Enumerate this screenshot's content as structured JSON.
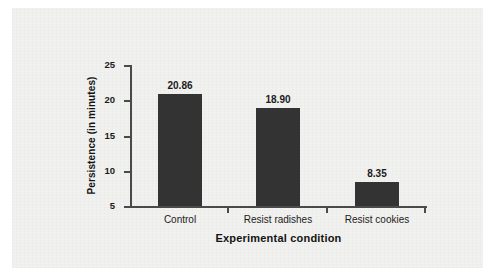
{
  "chart_data": {
    "type": "bar",
    "title": "",
    "subtitle": "",
    "xlabel": "Experimental condition",
    "ylabel": "Persistence (in minutes)",
    "categories": [
      "Control",
      "Resist radishes",
      "Resist cookies"
    ],
    "values": [
      20.86,
      18.9,
      8.35
    ],
    "value_labels": [
      "20.86",
      "18.90",
      "8.35"
    ],
    "ylim": [
      5,
      25
    ],
    "yticks": [
      5,
      10,
      15,
      20,
      25
    ],
    "ytick_labels": [
      "5",
      "10",
      "15",
      "20",
      "25"
    ],
    "grid": false,
    "legend": false,
    "legend_position": "none",
    "bar_color": "#333333",
    "axis_color": "#4a4a4a",
    "panel_background": "#f1f1ef",
    "page_background": "#ffffff",
    "text_color": "#1b1b1b"
  }
}
